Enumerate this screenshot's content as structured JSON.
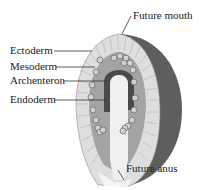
{
  "diagram": {
    "labels": {
      "future_mouth": "Future mouth",
      "ectoderm": "Ectoderm",
      "mesoderm": "Mesoderm",
      "archenteron": "Archenteron",
      "endoderm": "Endoderm",
      "future_anus": "Future anus"
    },
    "colors": {
      "outer_shell": "#5e5e5e",
      "ectoderm": "#d8d8d8",
      "mesoderm": "#9a9a9a",
      "archenteron_lining": "#4a4a4a",
      "archenteron_cavity": "#f2f2f2",
      "cells": "#c8c8c8"
    }
  }
}
